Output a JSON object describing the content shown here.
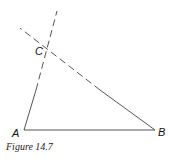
{
  "figure": {
    "caption": "Figure 14.7",
    "points": {
      "A": {
        "label": "A",
        "x": 24,
        "y": 130
      },
      "B": {
        "label": "B",
        "x": 155,
        "y": 130
      },
      "C": {
        "label": "C",
        "x": 47,
        "y": 50
      }
    },
    "segments": [
      {
        "from": "A",
        "to": "B",
        "style": "solid"
      },
      {
        "from": "A",
        "to": "C",
        "style": "solid-then-dashed",
        "extends_to": [
          57,
          11
        ]
      },
      {
        "from": "B",
        "to": "C",
        "style": "solid-then-dashed",
        "extends_to": [
          20,
          28
        ]
      }
    ],
    "line_color": "#555555"
  }
}
